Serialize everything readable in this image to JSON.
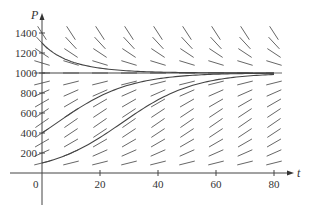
{
  "chart_data": {
    "type": "line",
    "title": "",
    "subtitle": "Direction field for logistic equation with solution curves",
    "xlabel": "t",
    "ylabel": "P",
    "xlim": [
      0,
      80
    ],
    "ylim": [
      0,
      1400
    ],
    "x_ticks": [
      20,
      40,
      60,
      80
    ],
    "x_tick_labels": [
      "20",
      "40",
      "60",
      "80"
    ],
    "y_ticks": [
      200,
      400,
      600,
      800,
      1000,
      1200,
      1400
    ],
    "y_tick_labels": [
      "200",
      "400",
      "600",
      "800",
      "1000",
      "1200",
      "1400"
    ],
    "origin_label": "0",
    "grid": false,
    "legend": null,
    "model": {
      "equation": "dP/dt = kP(1 - P/M)",
      "k": 0.08,
      "M": 1000
    },
    "direction_field": {
      "t_values": [
        0,
        10,
        20,
        30,
        40,
        50,
        60,
        70,
        80
      ],
      "P_values": [
        100,
        200,
        300,
        400,
        500,
        600,
        700,
        800,
        900,
        1000,
        1100,
        1200,
        1300,
        1400
      ]
    },
    "series": [
      {
        "name": "P(0)=1300",
        "initial_P": 1300,
        "t": [
          0,
          10,
          20,
          30,
          40,
          60,
          80
        ],
        "values": [
          1300,
          1085,
          1025,
          1008,
          1003,
          1000,
          1000
        ]
      },
      {
        "name": "P(0)=400",
        "initial_P": 400,
        "t": [
          0,
          10,
          20,
          30,
          40,
          60,
          80
        ],
        "values": [
          400,
          600,
          775,
          890,
          950,
          992,
          999
        ]
      },
      {
        "name": "P(0)=100",
        "initial_P": 100,
        "t": [
          0,
          10,
          20,
          30,
          40,
          60,
          80
        ],
        "values": [
          100,
          200,
          360,
          560,
          735,
          930,
          985
        ]
      },
      {
        "name": "P=1000 (equilibrium)",
        "initial_P": 1000,
        "t": [
          0,
          80
        ],
        "values": [
          1000,
          1000
        ]
      }
    ]
  }
}
